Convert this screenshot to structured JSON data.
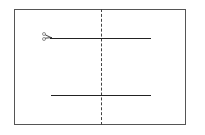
{
  "diagram": {
    "type": "paper-cutting-instruction",
    "sheet": {
      "border_color": "#555555"
    },
    "fold_line": {
      "style": "dashed",
      "orientation": "vertical",
      "color": "#444444"
    },
    "cut_lines": [
      {
        "position": "top",
        "style": "solid",
        "color": "#222222"
      },
      {
        "position": "bottom",
        "style": "solid",
        "color": "#222222"
      }
    ],
    "icons": [
      {
        "name": "scissors-icon",
        "position": "start of top cut line"
      }
    ]
  }
}
